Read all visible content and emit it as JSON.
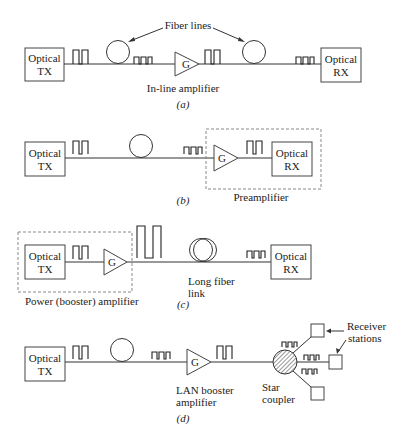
{
  "figure": {
    "panels": [
      {
        "id": "a",
        "caption": "(a)",
        "tx_label": [
          "Optical",
          "TX"
        ],
        "rx_label": [
          "Optical",
          "RX"
        ],
        "amp_symbol": "G",
        "amp_label": "In-line amplifier",
        "callout": "Fiber lines"
      },
      {
        "id": "b",
        "caption": "(b)",
        "tx_label": [
          "Optical",
          "TX"
        ],
        "rx_label": [
          "Optical",
          "RX"
        ],
        "amp_symbol": "G",
        "group_label": "Preamplifier"
      },
      {
        "id": "c",
        "caption": "(c)",
        "tx_label": [
          "Optical",
          "TX"
        ],
        "rx_label": [
          "Optical",
          "RX"
        ],
        "amp_symbol": "G",
        "group_label": "Power (booster) amplifier",
        "fiber_label": [
          "Long fiber",
          "link"
        ]
      },
      {
        "id": "d",
        "caption": "(d)",
        "tx_label": [
          "Optical",
          "TX"
        ],
        "amp_symbol": "G",
        "amp_label": [
          "LAN booster",
          "amplifier"
        ],
        "coupler_label": [
          "Star",
          "coupler"
        ],
        "receivers_label": [
          "Receiver",
          "stations"
        ]
      }
    ]
  }
}
